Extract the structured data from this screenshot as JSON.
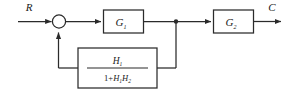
{
  "diagram": {
    "type": "control-system-block-diagram",
    "title": "",
    "background_color": "#ffffff",
    "line_color": "#2b2b2b",
    "text_color": "#1a1a1a",
    "signals": {
      "input_label": "R",
      "output_label": "C"
    },
    "summing_junction": {
      "name": "summing-junction",
      "shape": "circle",
      "signs": []
    },
    "takeoff_point": {
      "name": "takeoff-point",
      "shape": "dot"
    },
    "blocks": [
      {
        "id": "g1",
        "label": "G",
        "subscript": "1",
        "path": "forward"
      },
      {
        "id": "g2",
        "label": "G",
        "subscript": "2",
        "path": "forward"
      }
    ],
    "feedback_block": {
      "id": "h-block",
      "path": "feedback",
      "expression": "H1/(1+H1H2)",
      "numerator": {
        "base": "H",
        "subscript": "1"
      },
      "denominator": {
        "leading": "1",
        "operator": "+",
        "term1_base": "H",
        "term1_subscript": "1",
        "term2_base": "H",
        "term2_subscript": "2"
      }
    }
  }
}
